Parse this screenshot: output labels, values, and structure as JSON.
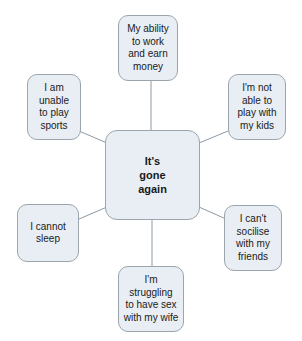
{
  "diagram": {
    "type": "mind-map",
    "title": "It's gone again",
    "colors": {
      "node_fill": "#e8eef4",
      "node_border": "#9aa5ad",
      "connector": "#8c9aa6",
      "text": "#1a1a1a",
      "background": "#ffffff"
    },
    "center": {
      "id": "center",
      "label": "It's\ngone\nagain"
    },
    "branches": [
      {
        "id": "top",
        "position": "top",
        "label": "My ability\nto work\nand earn\nmoney"
      },
      {
        "id": "topleft",
        "position": "top-left",
        "label": "I am\nunable\nto play\nsports"
      },
      {
        "id": "topright",
        "position": "top-right",
        "label": "I'm not\nable to\nplay with\nmy kids"
      },
      {
        "id": "botleft",
        "position": "bottom-left",
        "label": "I cannot\nsleep"
      },
      {
        "id": "botright",
        "position": "bottom-right",
        "label": "I can't\nsocilise\nwith my\nfriends"
      },
      {
        "id": "bottom",
        "position": "bottom",
        "label": "I'm\nstruggling\nto have sex\nwith my wife"
      }
    ]
  }
}
